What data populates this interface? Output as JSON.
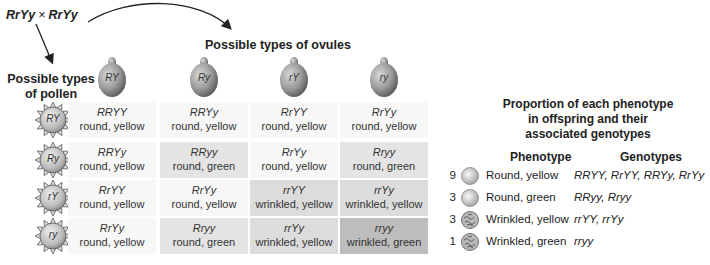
{
  "cross": {
    "parent1": "RrYy",
    "operator": "×",
    "parent2": "RrYy"
  },
  "ovules": {
    "title": "Possible types of ovules",
    "types": [
      "RY",
      "Ry",
      "rY",
      "ry"
    ]
  },
  "pollen": {
    "title_line1": "Possible types",
    "title_line2": "of pollen",
    "types": [
      "RY",
      "Ry",
      "rY",
      "ry"
    ]
  },
  "grid": [
    [
      {
        "genotype": "RRYY",
        "phenotype": "round, yellow",
        "shade": 0
      },
      {
        "genotype": "RRYy",
        "phenotype": "round, yellow",
        "shade": 0
      },
      {
        "genotype": "RrYY",
        "phenotype": "round, yellow",
        "shade": 0
      },
      {
        "genotype": "RrYy",
        "phenotype": "round, yellow",
        "shade": 0
      }
    ],
    [
      {
        "genotype": "RRYy",
        "phenotype": "round, yellow",
        "shade": 0
      },
      {
        "genotype": "RRyy",
        "phenotype": "round, green",
        "shade": 1
      },
      {
        "genotype": "RrYy",
        "phenotype": "round, yellow",
        "shade": 0
      },
      {
        "genotype": "Rryy",
        "phenotype": "round, green",
        "shade": 1
      }
    ],
    [
      {
        "genotype": "RrYY",
        "phenotype": "round, yellow",
        "shade": 0
      },
      {
        "genotype": "RrYy",
        "phenotype": "round, yellow",
        "shade": 0
      },
      {
        "genotype": "rrYY",
        "phenotype": "wrinkled, yellow",
        "shade": 2
      },
      {
        "genotype": "rrYy",
        "phenotype": "wrinkled, yellow",
        "shade": 2
      }
    ],
    [
      {
        "genotype": "RrYy",
        "phenotype": "round, yellow",
        "shade": 0
      },
      {
        "genotype": "Rryy",
        "phenotype": "round, green",
        "shade": 1
      },
      {
        "genotype": "rrYy",
        "phenotype": "wrinkled, yellow",
        "shade": 2
      },
      {
        "genotype": "rryy",
        "phenotype": "wrinkled, green",
        "shade": 3
      }
    ]
  ],
  "summary": {
    "title_line1": "Proportion of each phenotype",
    "title_line2": "in offspring and their",
    "title_line3": "associated genotypes",
    "phenotype_header": "Phenotype",
    "genotypes_header": "Genotypes",
    "rows": [
      {
        "count": "9",
        "icon": "round-seed",
        "phenotype": "Round, yellow",
        "genotypes": "RRYY, RrYY, RRYy, RrYy"
      },
      {
        "count": "3",
        "icon": "round-seed",
        "phenotype": "Round, green",
        "genotypes": "RRyy, Rryy"
      },
      {
        "count": "3",
        "icon": "wrinkled-seed",
        "phenotype": "Wrinkled, yellow",
        "genotypes": "rrYY, rrYy"
      },
      {
        "count": "1",
        "icon": "wrinkled-seed",
        "phenotype": "Wrinkled, green",
        "genotypes": "rryy"
      }
    ]
  }
}
